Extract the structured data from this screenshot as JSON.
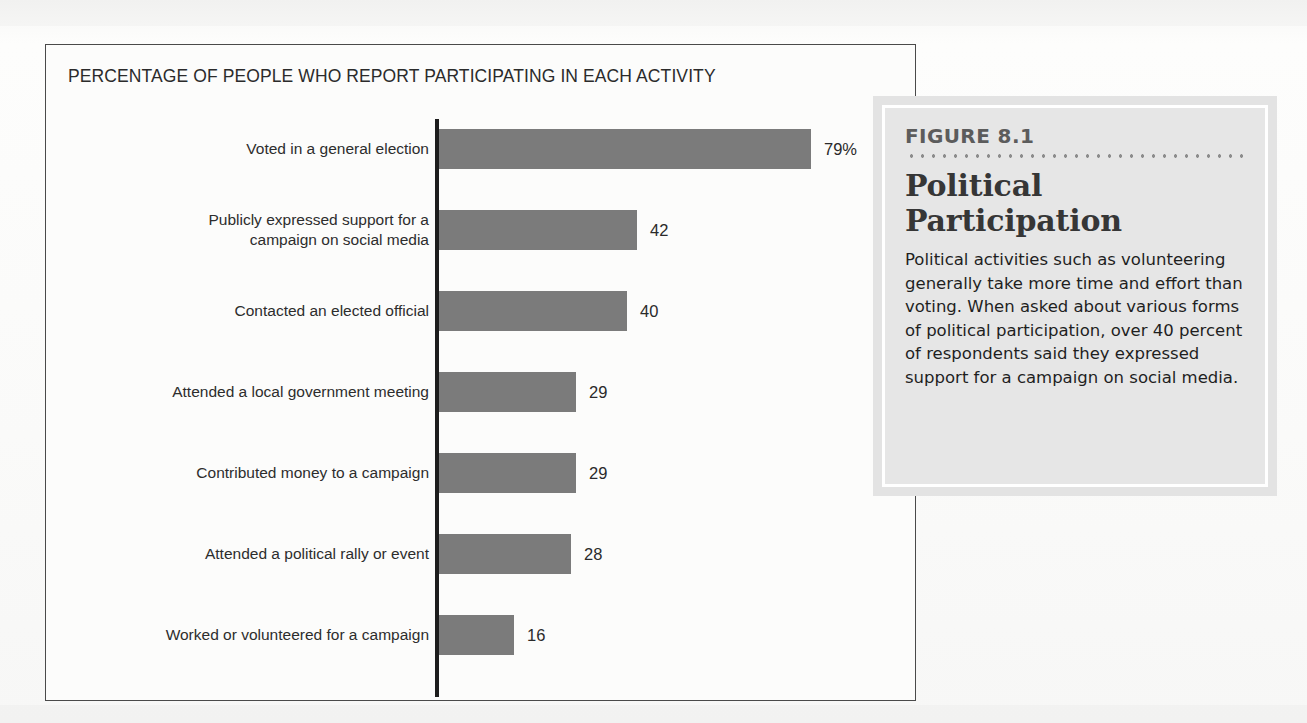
{
  "chart_panel": {
    "title": "PERCENTAGE OF PEOPLE WHO REPORT PARTICIPATING IN EACH ACTIVITY"
  },
  "figure_box": {
    "figure_number": "FIGURE 8.1",
    "figure_title": "Political Participation",
    "caption": "Political activities such as volunteering generally take more time and effort than voting. When asked about various forms of political participation, over 40 percent of respondents said they expressed support for a campaign on social media."
  },
  "colors": {
    "bar_fill": "#7b7b7b",
    "axis_line": "#1d1d1d",
    "panel_border": "#4a4a4a",
    "figure_box_background": "#e6e6e6",
    "figure_box_frame": "#ffffff",
    "figure_number_text": "#5c5c5c",
    "page_background": "#fbfbfa"
  },
  "chart_data": {
    "type": "bar",
    "orientation": "horizontal",
    "title": "PERCENTAGE OF PEOPLE WHO REPORT PARTICIPATING IN EACH ACTIVITY",
    "xlabel": "",
    "ylabel": "",
    "xlim": [
      0,
      79
    ],
    "grid": false,
    "legend": false,
    "unit": "percent",
    "categories": [
      "Voted in a general election",
      "Publicly expressed support for a campaign on social media",
      "Contacted an elected official",
      "Attended a local government meeting",
      "Contributed money to a campaign",
      "Attended a political rally or event",
      "Worked or volunteered for a campaign"
    ],
    "values": [
      79,
      42,
      40,
      29,
      29,
      28,
      16
    ],
    "bars": [
      {
        "label_line1": "Voted in a general election",
        "label_line2": "",
        "value": 79,
        "value_label": "79%"
      },
      {
        "label_line1": "Publicly expressed support for a",
        "label_line2": "campaign on social media",
        "value": 42,
        "value_label": "42"
      },
      {
        "label_line1": "Contacted an elected official",
        "label_line2": "",
        "value": 40,
        "value_label": "40"
      },
      {
        "label_line1": "Attended a local government meeting",
        "label_line2": "",
        "value": 29,
        "value_label": "29"
      },
      {
        "label_line1": "Contributed money to a campaign",
        "label_line2": "",
        "value": 29,
        "value_label": "29"
      },
      {
        "label_line1": "Attended a political rally or event",
        "label_line2": "",
        "value": 28,
        "value_label": "28"
      },
      {
        "label_line1": "Worked or volunteered for a campaign",
        "label_line2": "",
        "value": 16,
        "value_label": "16"
      }
    ]
  }
}
